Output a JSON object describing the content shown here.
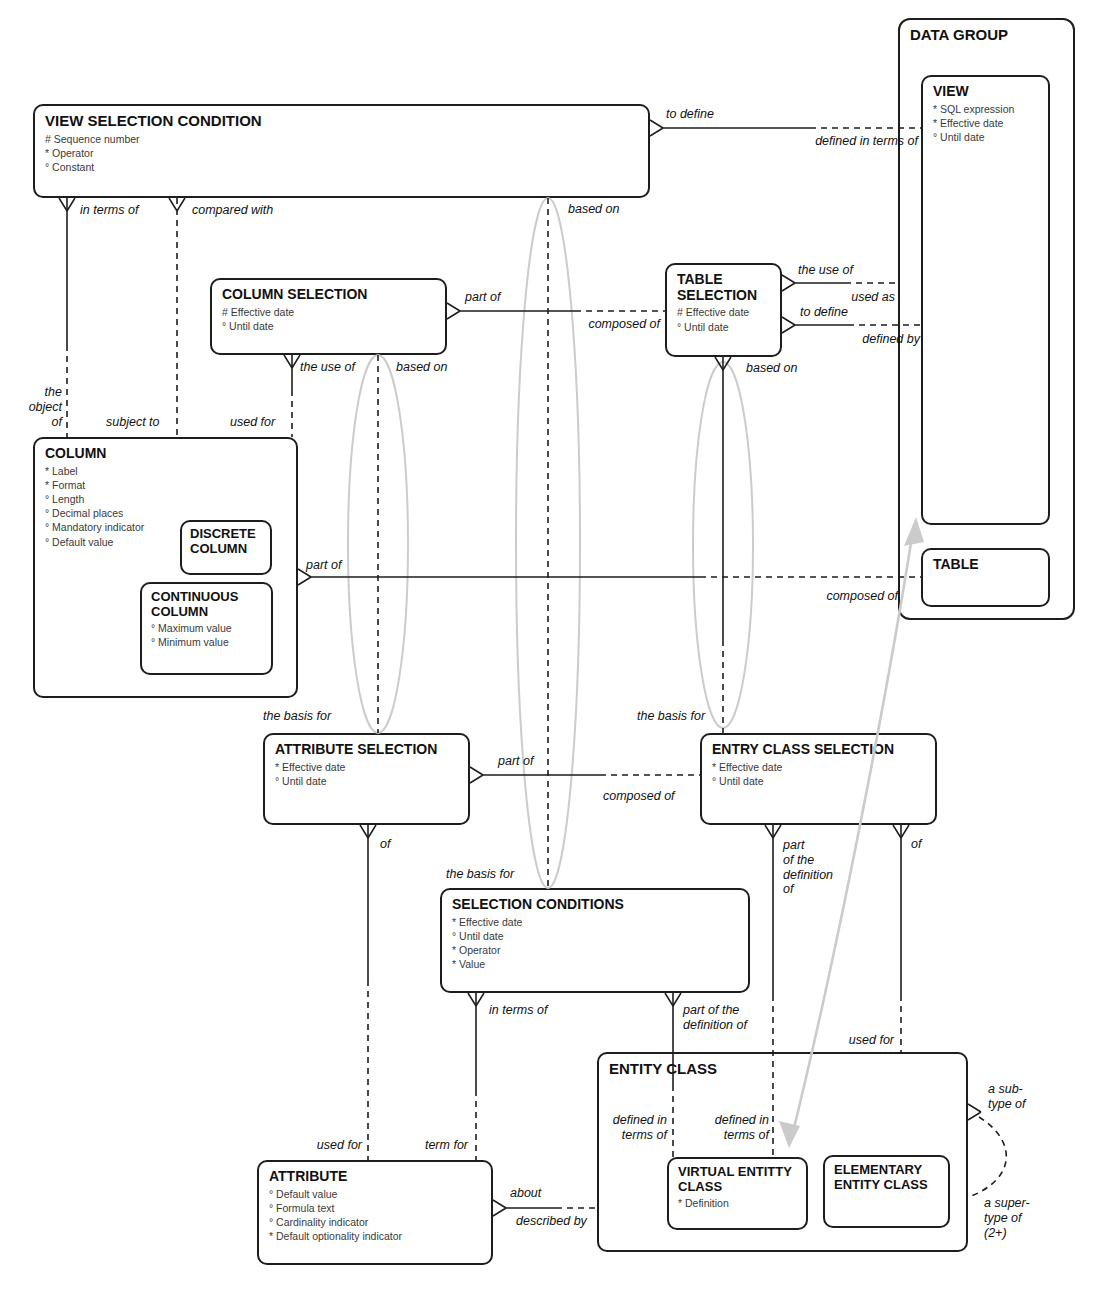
{
  "colors": {
    "line": "#1d1d1d",
    "gray_annotation": "#cbcbcb",
    "background": "#ffffff",
    "text": "#111111"
  },
  "entities": {
    "view_selection_condition": {
      "title": "VIEW SELECTION CONDITION",
      "attrs": [
        "# Sequence number",
        "* Operator",
        "° Constant"
      ]
    },
    "data_group": {
      "title": "DATA GROUP"
    },
    "view": {
      "title": "VIEW",
      "attrs": [
        "* SQL expression",
        "* Effective date",
        "° Until date"
      ]
    },
    "table": {
      "title": "TABLE"
    },
    "column_selection": {
      "title": "COLUMN SELECTION",
      "attrs": [
        "# Effective date",
        "° Until date"
      ]
    },
    "table_selection": {
      "title": "TABLE SELECTION",
      "attrs": [
        "# Effective date",
        "° Until date"
      ]
    },
    "column": {
      "title": "COLUMN",
      "attrs": [
        "* Label",
        "* Format",
        "° Length",
        "° Decimal places",
        "° Mandatory indicator",
        "° Default value"
      ]
    },
    "discrete_column": {
      "title": "DISCRETE COLUMN"
    },
    "continuous_column": {
      "title": "CONTINUOUS COLUMN",
      "attrs": [
        "° Maximum value",
        "° Minimum value"
      ]
    },
    "attribute_selection": {
      "title": "ATTRIBUTE SELECTION",
      "attrs": [
        "* Effective date",
        "° Until date"
      ]
    },
    "entry_class_selection": {
      "title": "ENTRY CLASS SELECTION",
      "attrs": [
        "* Effective date",
        "° Until date"
      ]
    },
    "selection_conditions": {
      "title": "SELECTION CONDITIONS",
      "attrs": [
        "* Effective date",
        "° Until date",
        "* Operator",
        "* Value"
      ]
    },
    "entity_class": {
      "title": "ENTITY CLASS"
    },
    "virtual_entity_class": {
      "title": "VIRTUAL ENTITTY CLASS",
      "attrs": [
        "* Definition"
      ]
    },
    "elementary_entity_class": {
      "title": "ELEMENTARY ENTITY CLASS"
    },
    "attribute": {
      "title": "ATTRIBUTE",
      "attrs": [
        "° Default value",
        "° Formula text",
        "° Cardinality indicator",
        "* Default optionality indicator"
      ]
    }
  },
  "rel_labels": [
    "in terms of",
    "compared with",
    "based on",
    "to define",
    "defined in terms of",
    "part of",
    "composed of",
    "the use of",
    "used as",
    "to define",
    "defined by",
    "the use of",
    "based on",
    "based on",
    "the\nobject\nof",
    "subject to",
    "used for",
    "part of",
    "composed of",
    "the basis for",
    "the basis for",
    "part of",
    "composed of",
    "of",
    "the basis for",
    "in terms of",
    "part of the\ndefinition of",
    "part\nof the\ndefinition\nof",
    "of",
    "used for",
    "defined in\nterms of",
    "defined in\nterms of",
    "used for",
    "term for",
    "about",
    "described by",
    "a sub-\ntype of",
    "a super-\ntype of\n(2+)"
  ]
}
